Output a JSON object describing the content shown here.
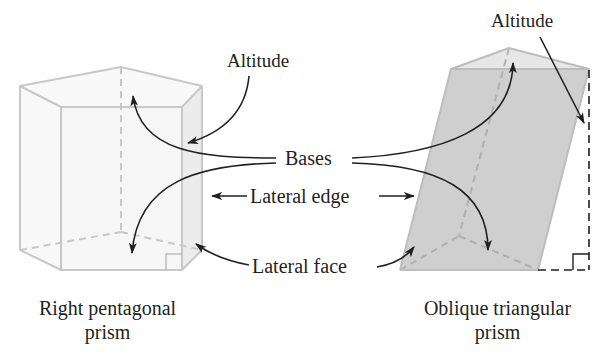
{
  "labels": {
    "altitude_left": "Altitude",
    "altitude_right": "Altitude",
    "bases": "Bases",
    "lateral_edge": "Lateral edge",
    "lateral_face": "Lateral face"
  },
  "captions": {
    "left_line1": "Right pentagonal",
    "left_line2": "prism",
    "right_line1": "Oblique triangular",
    "right_line2": "prism"
  },
  "colors": {
    "edge": "#c8c8c8",
    "dashed_edge": "#c8c8c8",
    "left_fill": "#f6f6f6",
    "left_side_fill": "#ececec",
    "right_fill": "#cfcfcf",
    "right_top_fill": "#e6e6e6",
    "arrow": "#231f20",
    "text": "#231f20"
  },
  "figures": [
    {
      "name": "Right pentagonal prism",
      "type": "right-prism",
      "base": "pentagon"
    },
    {
      "name": "Oblique triangular prism",
      "type": "oblique-prism",
      "base": "triangle"
    }
  ]
}
